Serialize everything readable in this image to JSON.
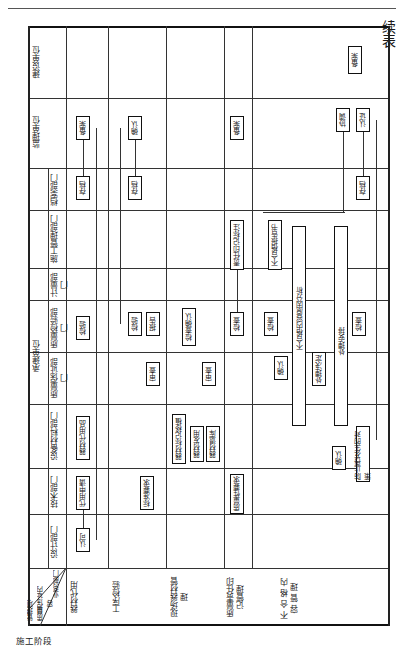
{
  "page": {
    "continued_label": "续表",
    "rotation": "table rotated 90 degrees"
  },
  "header": {
    "corner": {
      "top": "业务部门",
      "middle": "质量保证内容",
      "bottom": "管理项目"
    },
    "contractor_group": "承建单位",
    "departments": [
      {
        "id": "design",
        "label": "设计部门"
      },
      {
        "id": "tech",
        "label": "技术部门"
      },
      {
        "id": "equip",
        "label": "设备材料部门"
      },
      {
        "id": "qa",
        "label": "质量保证部门"
      },
      {
        "id": "qc",
        "label": "质量检验部门"
      },
      {
        "id": "metrology",
        "label": "计量部门"
      },
      {
        "id": "construction",
        "label": "施工管理部门"
      },
      {
        "id": "archive",
        "label": "档案部门"
      },
      {
        "id": "supervisor",
        "label": "监理单位"
      },
      {
        "id": "owner",
        "label": "建设单位"
      }
    ]
  },
  "stage": {
    "label": "施工阶段"
  },
  "rows": [
    {
      "label": "器材代用",
      "boxes": {
        "design": [
          "认可"
        ],
        "tech": [
          "代用申请"
        ],
        "equip": [
          "器材代用品"
        ],
        "qc": [
          "检验"
        ],
        "archive": [
          "存档"
        ],
        "supervisor": [
          "备案"
        ]
      }
    },
    {
      "label": "工序检验",
      "boxes": {
        "tech": [
          "标准要求"
        ],
        "qa": [
          "审查"
        ],
        "qc": [
          "检验",
          "报告"
        ],
        "archive": [
          "存档"
        ],
        "supervisor": [
          "确认"
        ]
      }
    },
    {
      "label": "现场器材管理",
      "boxes": {
        "equip": [
          "器材标记移植",
          "器材发用",
          "器材退库"
        ],
        "qa": [
          "审查"
        ],
        "qc": [
          "检查确认"
        ]
      }
    },
    {
      "label": "质量责任印记管理",
      "boxes": {
        "tech": [
          "质量性要求"
        ],
        "qc": [
          "检查"
        ],
        "construction": [
          "责任印记标注"
        ],
        "supervisor": [
          "备案"
        ]
      }
    },
    {
      "label": "不合格内容管理",
      "boxes": {
        "equip": [
          "确认",
          "防止再发生的对策"
        ],
        "qa": [
          "确认",
          "处理决定"
        ],
        "qc": [
          "检查",
          "检查"
        ],
        "construction": [
          "不合格报告书"
        ],
        "archive": [
          "存档"
        ],
        "supervisor": [
          "协调",
          "认证"
        ],
        "owner": [
          "备案"
        ]
      },
      "bars": [
        "不合格内容原因分析",
        "处理安排"
      ]
    }
  ]
}
